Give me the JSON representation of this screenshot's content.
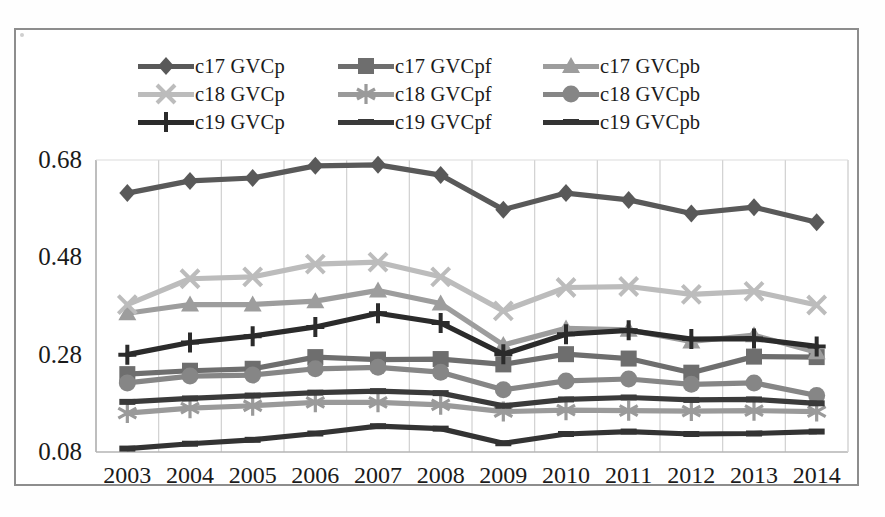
{
  "chart_data": {
    "type": "line",
    "title": "",
    "xlabel": "",
    "ylabel": "",
    "x": [
      "2003",
      "2004",
      "2005",
      "2006",
      "2007",
      "2008",
      "2009",
      "2010",
      "2011",
      "2012",
      "2013",
      "2014"
    ],
    "categories": [
      "2003",
      "2004",
      "2005",
      "2006",
      "2007",
      "2008",
      "2009",
      "2010",
      "2011",
      "2012",
      "2013",
      "2014"
    ],
    "ylim": [
      0.08,
      0.68
    ],
    "yticks": [
      0.08,
      0.28,
      0.48,
      0.68
    ],
    "ytick_labels": [
      "0.08",
      "0.28",
      "0.48",
      "0.68"
    ],
    "grid": "vertical",
    "legend_position": "top",
    "legend_columns": 3,
    "series": [
      {
        "name": "c17 GVCp",
        "marker": "diamond",
        "color": "#595959",
        "values": [
          0.612,
          0.637,
          0.643,
          0.668,
          0.67,
          0.649,
          0.578,
          0.612,
          0.598,
          0.57,
          0.583,
          0.552
        ]
      },
      {
        "name": "c17 GVCpf",
        "marker": "square",
        "color": "#6e6e6e",
        "values": [
          0.24,
          0.247,
          0.251,
          0.275,
          0.27,
          0.271,
          0.26,
          0.281,
          0.272,
          0.243,
          0.276,
          0.275
        ]
      },
      {
        "name": "c17 GVCpb",
        "marker": "triangle",
        "color": "#9d9d9d",
        "values": [
          0.365,
          0.383,
          0.383,
          0.39,
          0.412,
          0.385,
          0.3,
          0.334,
          0.331,
          0.307,
          0.32,
          0.285
        ]
      },
      {
        "name": "c18 GVCp",
        "marker": "cross",
        "color": "#bcbcbc",
        "values": [
          0.383,
          0.436,
          0.44,
          0.466,
          0.47,
          0.44,
          0.37,
          0.418,
          0.42,
          0.404,
          0.41,
          0.382
        ]
      },
      {
        "name": "c18 GVCpf",
        "marker": "asterisk",
        "color": "#9a9a9a",
        "values": [
          0.16,
          0.17,
          0.175,
          0.182,
          0.182,
          0.177,
          0.163,
          0.166,
          0.165,
          0.164,
          0.165,
          0.163
        ]
      },
      {
        "name": "c18 GVCpb",
        "marker": "circle",
        "color": "#868686",
        "values": [
          0.222,
          0.236,
          0.238,
          0.251,
          0.254,
          0.244,
          0.208,
          0.226,
          0.23,
          0.219,
          0.222,
          0.196
        ]
      },
      {
        "name": "c19 GVCp",
        "marker": "plus",
        "color": "#2b2b2b",
        "values": [
          0.28,
          0.305,
          0.318,
          0.337,
          0.365,
          0.345,
          0.281,
          0.322,
          0.33,
          0.312,
          0.313,
          0.297
        ]
      },
      {
        "name": "c19 GVCpf",
        "marker": "bar",
        "color": "#3a3a3a",
        "values": [
          0.183,
          0.19,
          0.196,
          0.202,
          0.205,
          0.201,
          0.175,
          0.188,
          0.192,
          0.187,
          0.188,
          0.18
        ]
      },
      {
        "name": "c19 GVCpb",
        "marker": "bar",
        "color": "#333333",
        "values": [
          0.087,
          0.097,
          0.105,
          0.118,
          0.133,
          0.128,
          0.098,
          0.117,
          0.122,
          0.117,
          0.118,
          0.122
        ]
      }
    ]
  },
  "legend": {
    "entries": [
      {
        "label": "c17 GVCp",
        "marker": "diamond",
        "color": "#595959",
        "icon": "diamond-marker-icon"
      },
      {
        "label": "c17 GVCpf",
        "marker": "square",
        "color": "#6e6e6e",
        "icon": "square-marker-icon"
      },
      {
        "label": "c17 GVCpb",
        "marker": "triangle",
        "color": "#9d9d9d",
        "icon": "triangle-marker-icon"
      },
      {
        "label": "c18 GVCp",
        "marker": "cross",
        "color": "#bcbcbc",
        "icon": "cross-marker-icon"
      },
      {
        "label": "c18 GVCpf",
        "marker": "asterisk",
        "color": "#9a9a9a",
        "icon": "asterisk-marker-icon"
      },
      {
        "label": "c18 GVCpb",
        "marker": "circle",
        "color": "#868686",
        "icon": "circle-marker-icon"
      },
      {
        "label": "c19 GVCp",
        "marker": "plus",
        "color": "#2b2b2b",
        "icon": "plus-marker-icon"
      },
      {
        "label": "c19 GVCpf",
        "marker": "bar",
        "color": "#3a3a3a",
        "icon": "bar-marker-icon"
      },
      {
        "label": "c19 GVCpb",
        "marker": "bar",
        "color": "#333333",
        "icon": "bar-marker-icon"
      }
    ]
  },
  "axes": {
    "y_tick_labels": [
      "0.68",
      "0.48",
      "0.28",
      "0.08"
    ],
    "x_tick_labels": [
      "2003",
      "2004",
      "2005",
      "2006",
      "2007",
      "2008",
      "2009",
      "2010",
      "2011",
      "2012",
      "2013",
      "2014"
    ]
  },
  "colors": {
    "grid": "#d0d0d0",
    "frame": "#8d8d8d",
    "text": "#1a1a1a",
    "background": "#ffffff"
  }
}
